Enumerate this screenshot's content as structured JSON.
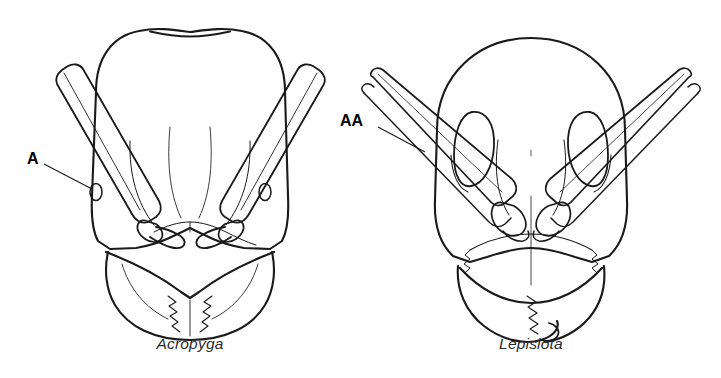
{
  "figure": {
    "background_color": "#ffffff",
    "line_color": "#1a1a1a",
    "width": 721,
    "height": 378
  },
  "panels": [
    {
      "id": "left",
      "caption": "Acropyga",
      "genus": "Acropyga",
      "description": "Full-face view of ant head with short antennal scapes that do not reach the posterior head margin, small eyes, and a nearly flat posterior head margin.",
      "scape_length": "short",
      "eye_size": "small",
      "posterior_margin": "flat"
    },
    {
      "id": "right",
      "caption": "Lepisiota",
      "genus": "Lepisiota",
      "description": "Full-face view of ant head with long antennal scapes that greatly surpass the posterior head margin, large oval eyes, and a rounded posterior head margin.",
      "scape_length": "long",
      "eye_size": "large",
      "posterior_margin": "rounded"
    }
  ],
  "annotations": [
    {
      "id": "label-a",
      "text": "A",
      "panel": "left",
      "points_to": "eye",
      "meaning": "antennal scape short"
    },
    {
      "id": "label-aa",
      "text": "AA",
      "panel": "right",
      "points_to": "antennal-scape",
      "meaning": "antennal scape long"
    }
  ]
}
